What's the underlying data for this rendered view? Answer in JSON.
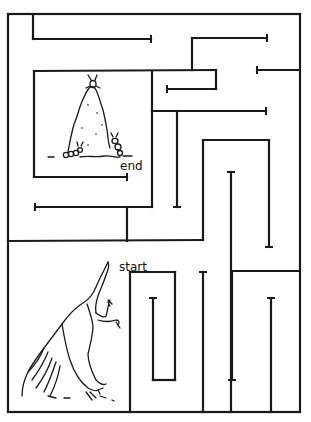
{
  "puzzle": {
    "type": "maze",
    "labels": {
      "start": "start",
      "end": "end"
    },
    "start_label_pos": [
      119,
      271
    ],
    "end_label_pos": [
      120,
      170
    ],
    "colors": {
      "ink": "#1a1a1a",
      "paper": "#ffffff"
    }
  },
  "maze": {
    "border": {
      "x1": 8,
      "y1": 14,
      "x2": 300,
      "y2": 412
    },
    "walls": [
      [
        33,
        15,
        33,
        39
      ],
      [
        33,
        39,
        151,
        39
      ],
      [
        192,
        38,
        267,
        38
      ],
      [
        192,
        38,
        192,
        70
      ],
      [
        34,
        71,
        216,
        70
      ],
      [
        216,
        70,
        216,
        89
      ],
      [
        216,
        89,
        167,
        89
      ],
      [
        257,
        70,
        299,
        70
      ],
      [
        34,
        71,
        34,
        177
      ],
      [
        34,
        177,
        127,
        177
      ],
      [
        152,
        71,
        152,
        207
      ],
      [
        152,
        111,
        266,
        111
      ],
      [
        177,
        111,
        177,
        207
      ],
      [
        35,
        207,
        152,
        207
      ],
      [
        127,
        207,
        127,
        241
      ],
      [
        8,
        241,
        203,
        240
      ],
      [
        203,
        240,
        203,
        140
      ],
      [
        203,
        140,
        269,
        140
      ],
      [
        269,
        140,
        269,
        247
      ],
      [
        231,
        172,
        231,
        412
      ],
      [
        232,
        271,
        299,
        271
      ],
      [
        130,
        272,
        130,
        412
      ],
      [
        130,
        272,
        175,
        272
      ],
      [
        175,
        272,
        175,
        380
      ],
      [
        175,
        380,
        153,
        380
      ],
      [
        153,
        380,
        153,
        298
      ],
      [
        203,
        272,
        203,
        412
      ],
      [
        232,
        272,
        232,
        380
      ],
      [
        271,
        298,
        271,
        412
      ]
    ],
    "caps": [
      [
        151,
        35,
        151,
        43
      ],
      [
        267,
        34,
        267,
        42
      ],
      [
        257,
        66,
        257,
        74
      ],
      [
        167,
        85,
        167,
        93
      ],
      [
        266,
        107,
        266,
        115
      ],
      [
        127,
        173,
        127,
        181
      ],
      [
        35,
        203,
        35,
        211
      ],
      [
        173,
        207,
        181,
        207
      ],
      [
        265,
        247,
        273,
        247
      ],
      [
        227,
        172,
        235,
        172
      ],
      [
        149,
        298,
        157,
        298
      ],
      [
        199,
        272,
        207,
        272
      ],
      [
        228,
        380,
        236,
        380
      ],
      [
        267,
        298,
        275,
        298
      ]
    ]
  }
}
